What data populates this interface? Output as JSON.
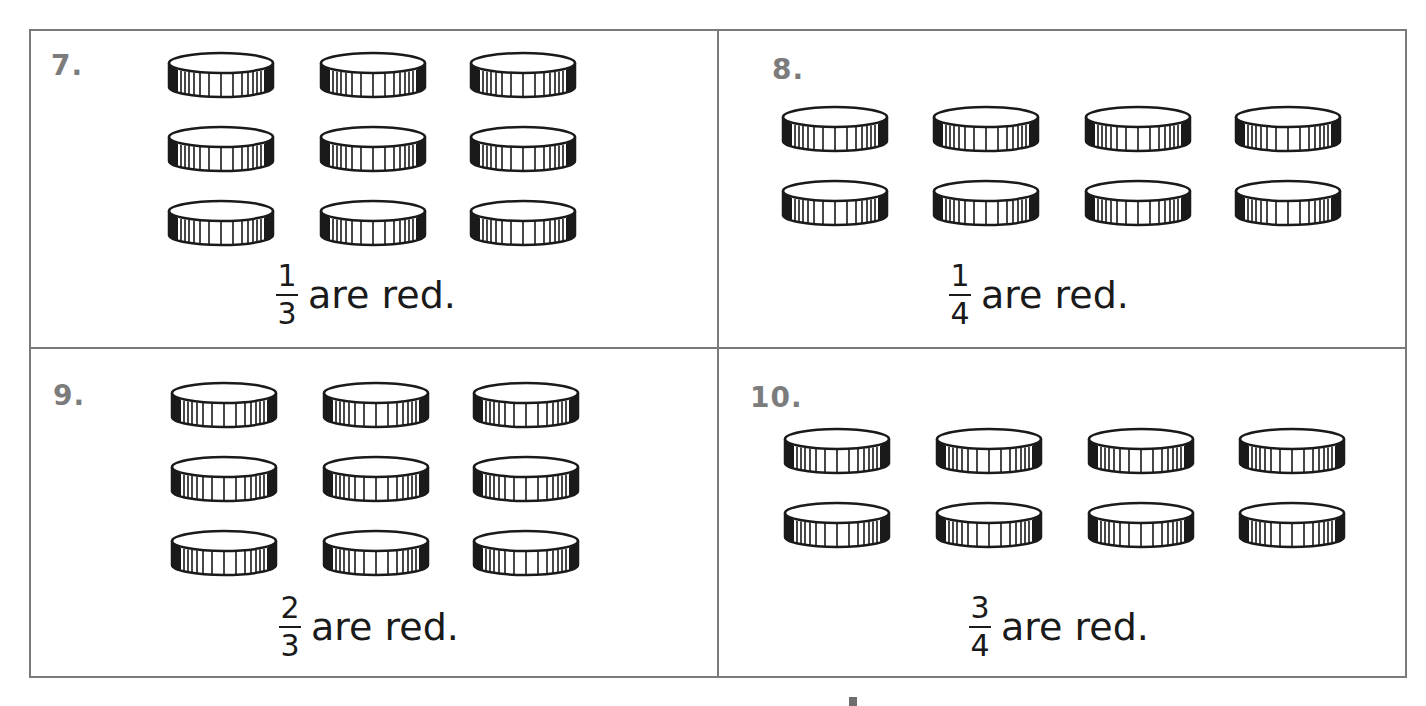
{
  "problems": [
    {
      "number": "7.",
      "layout": {
        "rows": 3,
        "cols": 3
      },
      "coin_count": 9,
      "numerator": "1",
      "denominator": "3",
      "caption": "are red."
    },
    {
      "number": "8.",
      "layout": {
        "rows": 2,
        "cols": 4
      },
      "coin_count": 8,
      "numerator": "1",
      "denominator": "4",
      "caption": "are red."
    },
    {
      "number": "9.",
      "layout": {
        "rows": 3,
        "cols": 3
      },
      "coin_count": 9,
      "numerator": "2",
      "denominator": "3",
      "caption": "are red."
    },
    {
      "number": "10.",
      "layout": {
        "rows": 2,
        "cols": 4
      },
      "coin_count": 8,
      "numerator": "3",
      "denominator": "4",
      "caption": "are red."
    }
  ],
  "colors": {
    "border": "#7a7a7a",
    "number_text": "#7c7c7c",
    "ink": "#1a1a1a"
  }
}
